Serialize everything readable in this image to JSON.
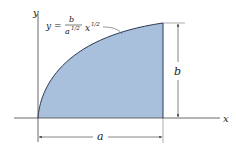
{
  "diagram": {
    "axes": {
      "x_label": "x",
      "y_label": "y"
    },
    "curve": {
      "equation_lhs": "y =",
      "numerator": "b",
      "denominator_base": "a",
      "denominator_exp": "1/2",
      "x_var": "x",
      "x_exp": "1/2"
    },
    "dimensions": {
      "width_label": "a",
      "height_label": "b"
    },
    "colors": {
      "fill": "#a9c0dd",
      "stroke": "#2a3a55",
      "line": "#333333"
    }
  }
}
